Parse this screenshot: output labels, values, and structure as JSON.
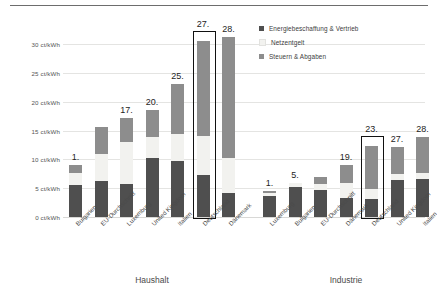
{
  "chart_data": {
    "type": "bar",
    "subtype": "stacked-bar-grouped",
    "title": "",
    "xlabel": "",
    "ylabel": "ct/kWh",
    "ylim": [
      0,
      30
    ],
    "ytick_step": 5,
    "ytick_labels": [
      "0 ct/kWh",
      "5 ct/kWh",
      "10 ct/kWh",
      "15 ct/kWh",
      "20 ct/kWh",
      "25 ct/kWh",
      "30 ct/kWh"
    ],
    "ytick_values": [
      0,
      5,
      10,
      15,
      20,
      25,
      30
    ],
    "grid": true,
    "legend_position": "top-right",
    "series": [
      {
        "name": "Energiebeschaffung & Vertrieb",
        "color": "#4f4f4f"
      },
      {
        "name": "Netzentgelt",
        "color": "#f2f2ef"
      },
      {
        "name": "Steuern & Abgaben",
        "color": "#8d8d8d"
      }
    ],
    "groups": [
      {
        "name": "Haushalt",
        "categories": [
          "Bulgarien",
          "EU-Durchschnitt",
          "Luxemburg",
          "United Kingdom",
          "Italien",
          "Deutschland",
          "Dänemark"
        ],
        "ranks": [
          "1.",
          "",
          "17.",
          "20.",
          "25.",
          "27.",
          "28."
        ],
        "highlighted": "Deutschland",
        "values": [
          {
            "category": "Bulgarien",
            "Energiebeschaffung & Vertrieb": 5.5,
            "Netzentgelt": 2.1,
            "Steuern & Abgaben": 1.5,
            "total": 9.1
          },
          {
            "category": "EU-Durchschnitt",
            "Energiebeschaffung & Vertrieb": 6.2,
            "Netzentgelt": 4.8,
            "Steuern & Abgaben": 4.6,
            "total": 15.6
          },
          {
            "category": "Luxemburg",
            "Energiebeschaffung & Vertrieb": 5.8,
            "Netzentgelt": 7.2,
            "Steuern & Abgaben": 4.1,
            "total": 17.1
          },
          {
            "category": "United Kingdom",
            "Energiebeschaffung & Vertrieb": 10.2,
            "Netzentgelt": 3.7,
            "Steuern & Abgaben": 4.6,
            "total": 18.5
          },
          {
            "category": "Italien",
            "Energiebeschaffung & Vertrieb": 9.7,
            "Netzentgelt": 4.7,
            "Steuern & Abgaben": 8.6,
            "total": 23.0
          },
          {
            "category": "Deutschland",
            "Energiebeschaffung & Vertrieb": 7.3,
            "Netzentgelt": 6.8,
            "Steuern & Abgaben": 16.4,
            "total": 30.5
          },
          {
            "category": "Dänemark",
            "Energiebeschaffung & Vertrieb": 4.2,
            "Netzentgelt": 6.0,
            "Steuern & Abgaben": 21.1,
            "total": 31.3
          }
        ]
      },
      {
        "name": "Industrie",
        "categories": [
          "Luxemburg",
          "Bulgarien",
          "EU-Durchschnitt",
          "Dänemark",
          "Deutschland",
          "United Kingdom",
          "Italien"
        ],
        "ranks": [
          "1.",
          "5.",
          "",
          "19.",
          "23.",
          "27.",
          "28."
        ],
        "highlighted": "Deutschland",
        "values": [
          {
            "category": "Luxemburg",
            "Energiebeschaffung & Vertrieb": 3.7,
            "Netzentgelt": 0.5,
            "Steuern & Abgaben": 0.3,
            "total": 4.5
          },
          {
            "category": "Bulgarien",
            "Energiebeschaffung & Vertrieb": 5.2,
            "Netzentgelt": 0.7,
            "Steuern & Abgaben": 0.0,
            "total": 5.9
          },
          {
            "category": "EU-Durchschnitt",
            "Energiebeschaffung & Vertrieb": 4.6,
            "Netzentgelt": 1.1,
            "Steuern & Abgaben": 1.3,
            "total": 7.0
          },
          {
            "category": "Dänemark",
            "Energiebeschaffung & Vertrieb": 3.3,
            "Netzentgelt": 2.6,
            "Steuern & Abgaben": 3.1,
            "total": 9.0
          },
          {
            "category": "Deutschland",
            "Energiebeschaffung & Vertrieb": 3.2,
            "Netzentgelt": 1.7,
            "Steuern & Abgaben": 7.4,
            "total": 12.3
          },
          {
            "category": "United Kingdom",
            "Energiebeschaffung & Vertrieb": 6.5,
            "Netzentgelt": 1.0,
            "Steuern & Abgaben": 4.6,
            "total": 12.1
          },
          {
            "category": "Italien",
            "Energiebeschaffung & Vertrieb": 6.6,
            "Netzentgelt": 1.0,
            "Steuern & Abgaben": 6.3,
            "total": 13.9
          }
        ]
      }
    ]
  },
  "legend": {
    "items": [
      {
        "label": "Energiebeschaffung & Vertrieb",
        "swatch": "s0"
      },
      {
        "label": "Netzentgelt",
        "swatch": "s1"
      },
      {
        "label": "Steuern & Abgaben",
        "swatch": "s2"
      }
    ]
  },
  "group_labels": [
    {
      "text": "Haushalt"
    },
    {
      "text": "Industrie"
    }
  ]
}
